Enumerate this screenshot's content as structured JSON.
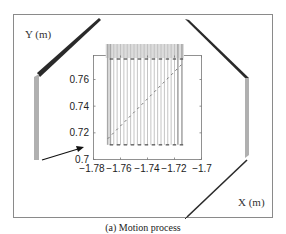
{
  "figure": {
    "caption": "(a) Motion process",
    "outer_axis_labels": {
      "y": "Y (m)",
      "x": "X (m)"
    },
    "colors": {
      "frame": "#8a8a8a",
      "link_dark": "#2a2a2a",
      "link_gray": "#b0b0b0",
      "trace_lines": "#b8b8b8",
      "dashed_path": "#777777",
      "arrow": "#111111"
    }
  },
  "chart_data": {
    "type": "line",
    "title": "",
    "xlabel": "",
    "ylabel": "",
    "xlim": [
      -1.78,
      -1.7
    ],
    "ylim": [
      0.7,
      0.775
    ],
    "x_ticks": [
      "-1.78",
      "-1.76",
      "-1.74",
      "-1.72",
      "-1.7"
    ],
    "y_ticks": [
      "0.7",
      "0.72",
      "0.74",
      "0.76"
    ],
    "grid": false,
    "series": [
      {
        "name": "end-effector path (dashed)",
        "x": [
          -1.7695,
          -1.7145
        ],
        "y": [
          0.7155,
          0.7715
        ]
      },
      {
        "name": "link positions (vertical traces)",
        "x": [
          -1.7695,
          -1.7675,
          -1.765,
          -1.7625,
          -1.76,
          -1.7575,
          -1.755,
          -1.7525,
          -1.75,
          -1.7475,
          -1.745,
          -1.7425,
          -1.74,
          -1.7375,
          -1.735,
          -1.7325,
          -1.73,
          -1.7275,
          -1.725,
          -1.7225,
          -1.72,
          -1.7175,
          -1.7145
        ],
        "y_range": [
          0.711,
          0.784
        ]
      }
    ],
    "annotations": [
      "arrow pointing to inset from left link",
      "arrow pointing left near x=-1.715, y=0.704"
    ]
  }
}
